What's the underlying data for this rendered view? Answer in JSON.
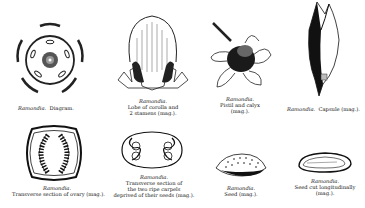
{
  "plate": {
    "genus": "Ramondia",
    "figures": [
      {
        "id": "diagram",
        "genus_label": "Ramondia.",
        "caption_lines": [
          "Diagram."
        ],
        "inline": true
      },
      {
        "id": "lobe-corolla",
        "genus_label": "Ramondia.",
        "caption_lines": [
          "Lobe of corolla and",
          "2 stamens (mag.)."
        ]
      },
      {
        "id": "pistil-calyx",
        "genus_label": "Ramondia.",
        "caption_lines": [
          "Pistil and calyx",
          "(mag.)."
        ]
      },
      {
        "id": "capsule",
        "genus_label": "Ramondia.",
        "caption_lines": [
          "Capsule (mag.)."
        ],
        "inline": true
      },
      {
        "id": "ovary-section",
        "genus_label": "Ramondia.",
        "caption_lines": [
          "Transverse section of ovary (mag.)."
        ]
      },
      {
        "id": "carpels-section",
        "genus_label": "Ramondia.",
        "caption_lines": [
          "Transverse section of",
          "the two ripe carpels",
          "deprived of their seeds (mag.)."
        ]
      },
      {
        "id": "seed",
        "genus_label": "Ramondia.",
        "caption_lines": [
          "Seed (mag.)."
        ]
      },
      {
        "id": "seed-longitudinal",
        "genus_label": "Ramondia.",
        "caption_lines": [
          "Seed cut longitudinally",
          "(mag.)."
        ]
      }
    ]
  }
}
